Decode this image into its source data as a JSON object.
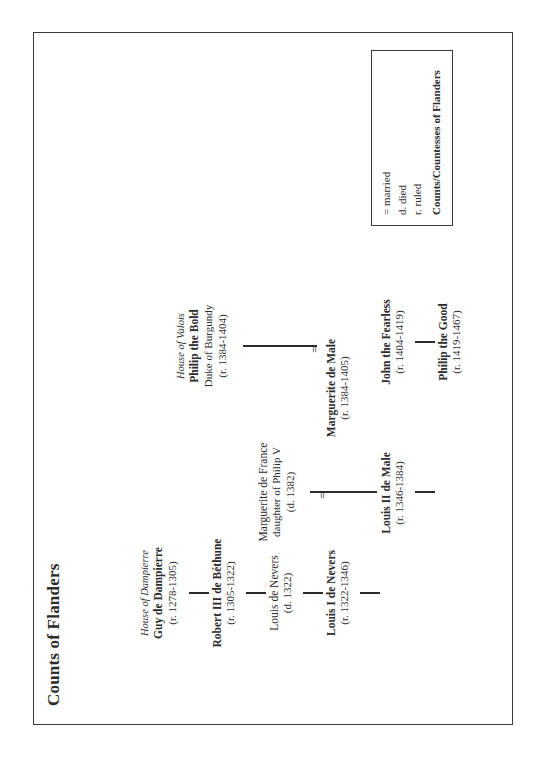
{
  "document": {
    "title": "Counts of Flanders"
  },
  "tree": {
    "nodes": [
      {
        "id": "guy-de-dampierre",
        "house": "House of Dampierre",
        "name": "Guy de Dampierre",
        "subtitle": "",
        "dates": "(r. 1278-1305)",
        "ruler": true
      },
      {
        "id": "robert-iii-de-bethune",
        "house": "",
        "name": "Robert III de Béthune",
        "subtitle": "",
        "dates": "(r. 1305-1322)",
        "ruler": true
      },
      {
        "id": "louis-de-nevers",
        "house": "",
        "name": "Louis de Nevers",
        "subtitle": "",
        "dates": "(d. 1322)",
        "ruler": false
      },
      {
        "id": "louis-i-de-nevers",
        "house": "",
        "name": "Louis I de Nevers",
        "subtitle": "",
        "dates": "(r. 1322-1346)",
        "ruler": true
      },
      {
        "id": "marguerite-de-france",
        "house": "",
        "name": "Marguerite de France",
        "subtitle": "daughter of Philip V",
        "dates": "(d. 1382)",
        "ruler": false
      },
      {
        "id": "louis-ii-de-male",
        "house": "",
        "name": "Louis II de Male",
        "subtitle": "",
        "dates": "(r. 1346-1384)",
        "ruler": true
      },
      {
        "id": "marguerite-de-male",
        "house": "",
        "name": "Marguerite de Male",
        "subtitle": "",
        "dates": "(r. 1384-1405)",
        "ruler": true
      },
      {
        "id": "philip-the-bold",
        "house": "House of Valois",
        "name": "Philip the Bold",
        "subtitle": "Duke of Burgundy",
        "dates": "(r. 1384-1404)",
        "ruler": true
      },
      {
        "id": "john-the-fearless",
        "house": "",
        "name": "John the Fearless",
        "subtitle": "",
        "dates": "(r. 1404-1419)",
        "ruler": true
      },
      {
        "id": "philip-the-good",
        "house": "",
        "name": "Philip the Good",
        "subtitle": "",
        "dates": "(r. 1419-1467)",
        "ruler": true
      }
    ],
    "marriage_symbol": "=",
    "line_color": "#2b2b2b"
  },
  "legend": {
    "lines": [
      "= married",
      "d. died",
      "r. ruled"
    ],
    "emphasis": "Counts/Countesses of Flanders"
  }
}
